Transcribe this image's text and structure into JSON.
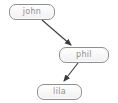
{
  "diagram": {
    "type": "directed-graph",
    "nodes": [
      {
        "id": "john",
        "label": "john"
      },
      {
        "id": "phil",
        "label": "phil"
      },
      {
        "id": "lila",
        "label": "lila"
      }
    ],
    "edges": [
      {
        "from": "john",
        "to": "phil"
      },
      {
        "from": "phil",
        "to": "lila"
      }
    ],
    "colors": {
      "background": "#ffffff",
      "node_border": "#8f8f8f",
      "node_text": "#8e8e8e",
      "edge": "#3c3c3c"
    }
  }
}
